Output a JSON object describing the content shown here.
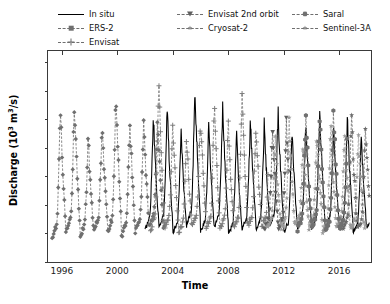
{
  "chart_data": {
    "type": "line",
    "title": "",
    "xlabel": "Time",
    "ylabel": "Discharge (10^3 m^3/s)",
    "ylabel_parts": {
      "text": "Discharge (10",
      "sup1": "3",
      "mid": " m",
      "sup2": "3",
      "tail": "/s)"
    },
    "xlim": [
      1995.0,
      2018.3
    ],
    "ylim": [
      0,
      14.8
    ],
    "yticks": [
      0,
      2,
      4,
      6,
      8,
      10,
      12,
      14
    ],
    "xticks": [
      1996,
      2000,
      2004,
      2008,
      2012,
      2016
    ],
    "grid": false,
    "legend_position": "above-axes",
    "legend_columns": 3,
    "series": [
      {
        "name": "In situ",
        "color": "#000000",
        "linestyle": "solid",
        "marker": "none",
        "x_range": [
          2002.0,
          2018.2
        ],
        "peaks": [
          10.6,
          11.1,
          9.5,
          12.5,
          10.0,
          11.2,
          9.2,
          10.3,
          9.9,
          10.8,
          9.4,
          10.1,
          11.0,
          9.6,
          10.4,
          9.0,
          10.2
        ],
        "lows": [
          1.9,
          2.0,
          1.7,
          2.2,
          1.8,
          2.1,
          1.6,
          2.0,
          1.9,
          2.2,
          1.7,
          2.0,
          1.8,
          2.1,
          1.9,
          1.7,
          2.0
        ]
      },
      {
        "name": "ERS-2",
        "color": "#6f6f6f",
        "linestyle": "dashed",
        "marker": "diamond",
        "x_range": [
          1995.3,
          2003.4
        ],
        "peaks": [
          11.2,
          11.3,
          9.0,
          9.7,
          12.2,
          10.5,
          9.9,
          10.4
        ],
        "lows": [
          1.3,
          1.8,
          1.5,
          2.0,
          1.6,
          1.4,
          1.9,
          2.1
        ]
      },
      {
        "name": "Envisat",
        "color": "#7a7a7a",
        "linestyle": "dashed",
        "marker": "plus",
        "x_range": [
          2002.4,
          2010.9
        ],
        "peaks": [
          13.1,
          10.1,
          9.2,
          10.6,
          11.4,
          10.0,
          12.5,
          9.8,
          10.9
        ],
        "lows": [
          1.8,
          2.1,
          1.7,
          2.3,
          1.9,
          2.0,
          1.8,
          2.2,
          2.0
        ]
      },
      {
        "name": "Envisat 2nd orbit",
        "color": "#5f5f5f",
        "linestyle": "dashed",
        "marker": "triangle-down",
        "x_range": [
          2010.6,
          2012.4
        ],
        "peaks": [
          9.4,
          10.0
        ],
        "lows": [
          2.0,
          1.9
        ]
      },
      {
        "name": "Cryosat-2",
        "color": "#9a9a9a",
        "linestyle": "dashed",
        "marker": "star",
        "x_range": [
          2010.8,
          2017.9
        ],
        "peaks": [
          9.0,
          10.2,
          8.6,
          9.5,
          10.0,
          8.9,
          9.3
        ],
        "lows": [
          2.1,
          1.9,
          2.3,
          2.0,
          1.8,
          2.2,
          2.0
        ]
      },
      {
        "name": "Saral",
        "color": "#707070",
        "linestyle": "dashed",
        "marker": "hexagon",
        "x_range": [
          2013.0,
          2016.6
        ],
        "peaks": [
          11.1,
          10.3,
          10.9,
          9.6
        ],
        "lows": [
          1.9,
          2.1,
          1.8,
          2.0
        ]
      },
      {
        "name": "Sentinel-3A",
        "color": "#6a6a6a",
        "linestyle": "dashed",
        "marker": "star",
        "x_range": [
          2016.3,
          2018.2
        ],
        "peaks": [
          10.4,
          9.8
        ],
        "lows": [
          2.0,
          1.9
        ]
      }
    ]
  },
  "legend": {
    "columns": [
      [
        {
          "label": "In situ",
          "marker": "none",
          "style": "solid"
        },
        {
          "label": "ERS-2",
          "marker": "diamond",
          "style": "dashed"
        },
        {
          "label": "Envisat",
          "marker": "plus",
          "style": "dashed"
        }
      ],
      [
        {
          "label": "Envisat 2nd orbit",
          "marker": "triangle-down",
          "style": "dashed"
        },
        {
          "label": "Cryosat-2",
          "marker": "star",
          "style": "dashed"
        }
      ],
      [
        {
          "label": "Saral",
          "marker": "hexagon",
          "style": "dashed"
        },
        {
          "label": "Sentinel-3A",
          "marker": "star",
          "style": "dashed"
        }
      ]
    ]
  },
  "axes": {
    "ytick_labels": [
      "0",
      "2",
      "4",
      "6",
      "8",
      "10",
      "12",
      "14"
    ],
    "xtick_labels": [
      "1996",
      "2000",
      "2004",
      "2008",
      "2012",
      "2016"
    ],
    "xlabel": "Time"
  }
}
